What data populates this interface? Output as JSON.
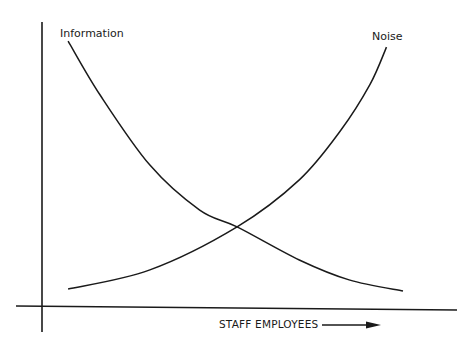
{
  "chart_data": {
    "type": "line",
    "title": "",
    "xlabel": "STAFF EMPLOYEES",
    "ylabel": "",
    "xlim": [
      0,
      10
    ],
    "ylim": [
      0,
      10
    ],
    "grid": false,
    "x_ticks": [],
    "y_ticks": [],
    "xlabel_arrow": true,
    "series": [
      {
        "name": "Information",
        "label_position": "top-left",
        "x": [
          0.63,
          1.4,
          2.6,
          3.8,
          4.7,
          6.2,
          7.4,
          8.7
        ],
        "y": [
          9.33,
          7.44,
          4.98,
          3.4,
          2.81,
          1.65,
          0.95,
          0.56
        ]
      },
      {
        "name": "Noise",
        "label_position": "top-right",
        "x": [
          0.63,
          2.6,
          4.7,
          6.2,
          7.2,
          7.9,
          8.3
        ],
        "y": [
          0.63,
          1.3,
          2.81,
          4.46,
          6.2,
          7.8,
          9.12
        ]
      }
    ],
    "annotations": [
      {
        "text": "intersection",
        "x": 4.7,
        "y": 2.81,
        "visible_text": false
      }
    ]
  }
}
